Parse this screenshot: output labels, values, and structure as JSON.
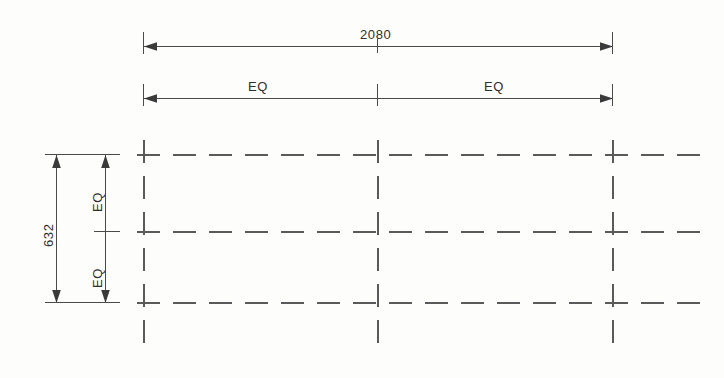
{
  "drawing": {
    "type": "cad-dimensioned-grid",
    "background_color": "#fdfdfb",
    "line_color": "#4a4a4a",
    "dash_color": "#5a5a5a",
    "text_color": "#2e2e2e"
  },
  "dimensions": {
    "overall_width": {
      "label": "2080",
      "name": "overall-width-dimension",
      "orientation": "horizontal"
    },
    "overall_height": {
      "label": "632",
      "name": "overall-height-dimension",
      "orientation": "vertical"
    },
    "horizontal_equal_spans": [
      {
        "label": "EQ"
      },
      {
        "label": "EQ"
      }
    ],
    "vertical_equal_spans": [
      {
        "label": "EQ"
      },
      {
        "label": "EQ"
      }
    ]
  },
  "grid": {
    "horizontal_lines": 3,
    "vertical_lines": 3,
    "style": "dashed-centerline"
  }
}
